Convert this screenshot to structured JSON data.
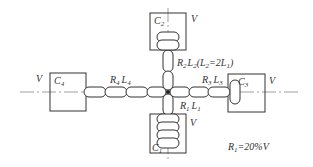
{
  "diagram": {
    "cores": [
      {
        "id": "C1",
        "name": "C",
        "sub": "1",
        "voltage": "V"
      },
      {
        "id": "C2",
        "name": "C",
        "sub": "2",
        "voltage": "V"
      },
      {
        "id": "C3",
        "name": "C",
        "sub": "3",
        "voltage": "V"
      },
      {
        "id": "C4",
        "name": "C",
        "sub": "4",
        "voltage": "V"
      }
    ],
    "branches": [
      {
        "id": "1",
        "label_r": "R",
        "r_sub": "1",
        "label_l": "L",
        "l_sub": "1"
      },
      {
        "id": "2",
        "label_r": "R",
        "r_sub": "2",
        "label_l": "L",
        "l_sub": "2",
        "note_open": "(",
        "note_l": "L",
        "note_l_sub": "2",
        "note_eq": "=2",
        "note_l2": "L",
        "note_l2_sub": "1",
        "note_close": ")"
      },
      {
        "id": "3",
        "label_r": "R",
        "r_sub": "3",
        "label_l": "L",
        "l_sub": "3"
      },
      {
        "id": "4",
        "label_r": "R",
        "r_sub": "4",
        "label_l": "L",
        "l_sub": "4"
      }
    ],
    "formula": {
      "lhs": "R",
      "lhs_sub": "1",
      "rhs": "=20%V"
    },
    "colors": {
      "line": "#333333",
      "background": "#ffffff"
    }
  }
}
